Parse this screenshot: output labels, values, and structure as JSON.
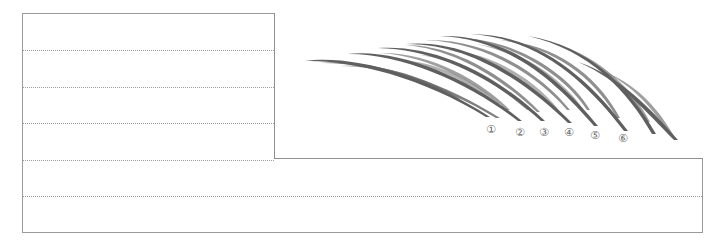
{
  "worksheet": {
    "practice_lines_left": [
      50,
      87,
      123,
      160
    ],
    "practice_lines_full": [
      196
    ]
  },
  "diagram": {
    "stroke_color": "#4a4a4a",
    "labels": [
      {
        "text": "①",
        "x": 486,
        "y": 124
      },
      {
        "text": "②",
        "x": 515,
        "y": 127
      },
      {
        "text": "③",
        "x": 539,
        "y": 127
      },
      {
        "text": "④",
        "x": 564,
        "y": 127
      },
      {
        "text": "⑤",
        "x": 590,
        "y": 130
      },
      {
        "text": "⑥",
        "x": 618,
        "y": 133
      }
    ]
  }
}
